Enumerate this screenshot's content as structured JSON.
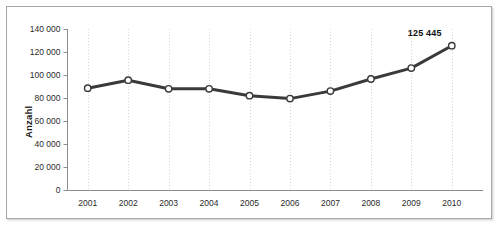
{
  "chart_data": {
    "type": "line",
    "title": "",
    "subtitle": "",
    "xlabel": "",
    "ylabel": "Anzahl",
    "categories": [
      "2001",
      "2002",
      "2003",
      "2004",
      "2005",
      "2006",
      "2007",
      "2008",
      "2009",
      "2010"
    ],
    "values": [
      88500,
      95500,
      88000,
      88000,
      82000,
      79500,
      86000,
      96500,
      106000,
      125445
    ],
    "series": [
      {
        "name": "Anzahl",
        "values": [
          88500,
          95500,
          88000,
          88000,
          82000,
          79500,
          86000,
          96500,
          106000,
          125445
        ]
      }
    ],
    "point_labels": [
      "",
      "",
      "",
      "",
      "",
      "",
      "",
      "",
      "",
      "125 445"
    ],
    "ylim": [
      0,
      140000
    ],
    "y_ticks": [
      0,
      20000,
      40000,
      60000,
      80000,
      100000,
      120000,
      140000
    ],
    "y_tick_labels": [
      "0",
      "20 000",
      "40 000",
      "60 000",
      "80 000",
      "100 000",
      "120 000",
      "140 000"
    ],
    "x_tick_labels": [
      "2001",
      "2002",
      "2003",
      "2004",
      "2005",
      "2006",
      "2007",
      "2008",
      "2009",
      "2010"
    ],
    "grid": {
      "vertical": true,
      "horizontal": false,
      "style": "dotted"
    },
    "legend": {
      "visible": false,
      "position": "none"
    },
    "colors": {
      "line": "#3a3a3a",
      "marker_fill": "#ffffff",
      "marker_stroke": "#3a3a3a",
      "axis": "#8c8c8c",
      "grid": "#d8d8d8",
      "text": "#1a1a1a",
      "frame": "#a8a8a8",
      "background": "#ffffff"
    },
    "marker": "circle",
    "line_width": 3
  }
}
